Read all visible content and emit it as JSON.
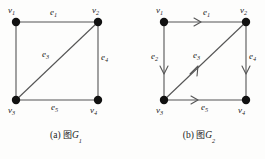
{
  "figure": {
    "background_color": "#fdfdfc",
    "stroke_color": "#4a4a4a",
    "vertex_color": "#111111",
    "panels": [
      {
        "id": "a",
        "caption_prefix": "(a)",
        "caption_cn": "图",
        "caption_graph": "G",
        "caption_graph_sub": "1",
        "directed": false,
        "vertices": [
          {
            "name": "v1",
            "label": "v",
            "sub": "1",
            "x": 16,
            "y": 22,
            "label_x": 8,
            "label_y": 8
          },
          {
            "name": "v2",
            "label": "v",
            "sub": "2",
            "x": 98,
            "y": 22,
            "label_x": 92,
            "label_y": 8
          },
          {
            "name": "v3",
            "label": "v",
            "sub": "3",
            "x": 16,
            "y": 100,
            "label_x": 8,
            "label_y": 108
          },
          {
            "name": "v4",
            "label": "v",
            "sub": "4",
            "x": 98,
            "y": 100,
            "label_x": 92,
            "label_y": 108
          }
        ],
        "edges": [
          {
            "name": "e1",
            "label": "e",
            "sub": "1",
            "from": "v1",
            "to": "v2",
            "label_x": 52,
            "label_y": 9,
            "arrow": false
          },
          {
            "name": "e2",
            "label": "",
            "sub": "",
            "from": "v1",
            "to": "v3",
            "label_x": 0,
            "label_y": 0,
            "arrow": false
          },
          {
            "name": "e3",
            "label": "e",
            "sub": "3",
            "from": "v3",
            "to": "v2",
            "label_x": 43,
            "label_y": 50,
            "arrow": false
          },
          {
            "name": "e4",
            "label": "e",
            "sub": "4",
            "from": "v2",
            "to": "v4",
            "label_x": 102,
            "label_y": 53,
            "arrow": false
          },
          {
            "name": "e5",
            "label": "e",
            "sub": "5",
            "from": "v3",
            "to": "v4",
            "label_x": 52,
            "label_y": 104,
            "arrow": false
          }
        ]
      },
      {
        "id": "b",
        "caption_prefix": "(b)",
        "caption_cn": "图",
        "caption_graph": "G",
        "caption_graph_sub": "2",
        "directed": true,
        "vertices": [
          {
            "name": "v1",
            "label": "v",
            "sub": "1",
            "x": 31,
            "y": 22,
            "label_x": 23,
            "label_y": 8
          },
          {
            "name": "v2",
            "label": "v",
            "sub": "2",
            "x": 113,
            "y": 22,
            "label_x": 107,
            "label_y": 8
          },
          {
            "name": "v3",
            "label": "v",
            "sub": "3",
            "x": 31,
            "y": 100,
            "label_x": 23,
            "label_y": 108
          },
          {
            "name": "v4",
            "label": "v",
            "sub": "4",
            "x": 113,
            "y": 100,
            "label_x": 107,
            "label_y": 108
          }
        ],
        "edges": [
          {
            "name": "e1",
            "label": "e",
            "sub": "1",
            "from": "v1",
            "to": "v2",
            "direction": "right",
            "label_x": 70,
            "label_y": 9
          },
          {
            "name": "e2",
            "label": "e",
            "sub": "2",
            "from": "v1",
            "to": "v3",
            "direction": "down",
            "label_x": 19,
            "label_y": 53
          },
          {
            "name": "e3",
            "label": "e",
            "sub": "3",
            "from": "v3",
            "to": "v2",
            "direction": "up-right",
            "label_x": 61,
            "label_y": 52
          },
          {
            "name": "e4",
            "label": "e",
            "sub": "4",
            "from": "v2",
            "to": "v4",
            "direction": "down",
            "label_x": 117,
            "label_y": 53
          },
          {
            "name": "e5",
            "label": "e",
            "sub": "5",
            "from": "v3",
            "to": "v4",
            "direction": "right",
            "label_x": 69,
            "label_y": 103
          }
        ]
      }
    ]
  }
}
